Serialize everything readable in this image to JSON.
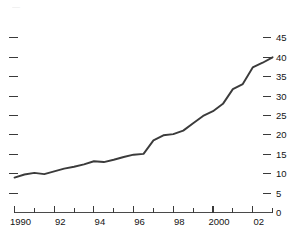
{
  "chart_data": {
    "type": "line",
    "title": "",
    "subtitle": "",
    "xlabel": "",
    "ylabel": "",
    "xlim": [
      1990,
      2003
    ],
    "ylim": [
      0,
      45
    ],
    "grid": false,
    "legend": null,
    "y_axis_position": "right",
    "y_ticks": [
      45,
      40,
      35,
      30,
      25,
      20,
      15,
      10,
      5,
      0
    ],
    "y_tick_labels": [
      "45",
      "40",
      "35",
      "30",
      "25",
      "20",
      "15",
      "10",
      "5",
      "0"
    ],
    "x_ticks": [
      1990,
      1991,
      1992,
      1993,
      1994,
      1995,
      1996,
      1997,
      1998,
      1999,
      2000,
      2001,
      2002,
      2003
    ],
    "x_tick_labels": [
      "1990",
      "",
      "92",
      "",
      "94",
      "",
      "96",
      "",
      "98",
      "",
      "2000",
      "",
      "02",
      ""
    ],
    "left_axis_ticks_unlabeled": [
      45,
      40,
      35,
      30,
      25,
      20,
      15,
      10,
      5
    ],
    "series": [
      {
        "name": "series-1",
        "color": "#3b3b3b",
        "x": [
          1990.0,
          1990.5,
          1991.0,
          1991.5,
          1992.0,
          1992.5,
          1993.0,
          1993.5,
          1994.0,
          1994.5,
          1995.0,
          1995.5,
          1996.0,
          1996.5,
          1997.0,
          1997.5,
          1998.0,
          1998.5,
          1999.0,
          1999.5,
          2000.0,
          2000.5,
          2001.0,
          2001.5,
          2002.0,
          2002.5,
          2003.0
        ],
        "values": [
          9.0,
          9.8,
          10.2,
          9.9,
          10.6,
          11.3,
          11.8,
          12.4,
          13.2,
          13.0,
          13.6,
          14.3,
          14.9,
          15.1,
          18.6,
          19.9,
          20.2,
          21.1,
          23.0,
          24.9,
          26.1,
          28.0,
          31.8,
          33.1,
          37.4,
          38.6,
          40.0
        ]
      }
    ],
    "annotations": [],
    "cropped_top_text": "—"
  }
}
